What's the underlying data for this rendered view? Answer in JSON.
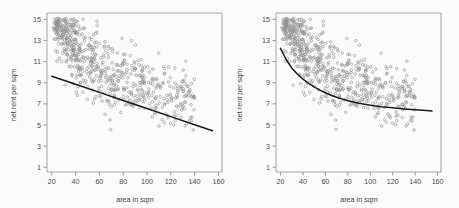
{
  "figure": {
    "background_color": "#fbfbfb",
    "point_color": "#8f8f8f",
    "line_color": "#1a1a1a",
    "axis_color": "#8d8d8d",
    "panels": 2
  },
  "chart_data": [
    {
      "type": "scatter",
      "title": "",
      "subtitle": "",
      "panel": "left",
      "xlabel": "area in sqm",
      "ylabel": "net rent per sqm",
      "xlim": [
        16,
        163
      ],
      "ylim": [
        0.55,
        15.6
      ],
      "xticks": [
        20,
        40,
        60,
        80,
        100,
        120,
        140,
        160
      ],
      "xticklabels": [
        "20",
        "40",
        "60",
        "80",
        "100",
        "120",
        "140",
        "160"
      ],
      "yticks": [
        1,
        3,
        5,
        7,
        9,
        11,
        13,
        15
      ],
      "yticklabels": [
        "1",
        "3",
        "5",
        "7",
        "9",
        "11",
        "13",
        "15"
      ],
      "grid": false,
      "legend": null,
      "annotations": [],
      "series": [
        {
          "name": "observations",
          "marker": "open-circle",
          "color": "#8f8f8f",
          "n_points": 620,
          "x_range": [
            20,
            155
          ],
          "y_range": [
            2.0,
            15.0
          ]
        },
        {
          "name": "linear fit",
          "type": "line",
          "color": "#1a1a1a",
          "x": [
            20,
            40,
            60,
            80,
            100,
            120,
            140,
            155
          ],
          "y": [
            9.62,
            8.85,
            8.09,
            7.32,
            6.56,
            5.79,
            5.03,
            4.45
          ]
        }
      ]
    },
    {
      "type": "scatter",
      "title": "",
      "subtitle": "",
      "panel": "right",
      "xlabel": "area in sqm",
      "ylabel": "net rent per sqm",
      "xlim": [
        16,
        163
      ],
      "ylim": [
        0.55,
        15.6
      ],
      "xticks": [
        20,
        40,
        60,
        80,
        100,
        120,
        140,
        160
      ],
      "xticklabels": [
        "20",
        "40",
        "60",
        "80",
        "100",
        "120",
        "140",
        "160"
      ],
      "yticks": [
        1,
        3,
        5,
        7,
        9,
        11,
        13,
        15
      ],
      "yticklabels": [
        "1",
        "3",
        "5",
        "7",
        "9",
        "11",
        "13",
        "15"
      ],
      "grid": false,
      "legend": null,
      "annotations": [],
      "series": [
        {
          "name": "observations",
          "marker": "open-circle",
          "color": "#8f8f8f",
          "n_points": 620,
          "x_range": [
            20,
            155
          ],
          "y_range": [
            2.0,
            15.0
          ]
        },
        {
          "name": "smooth fit",
          "type": "line",
          "color": "#1a1a1a",
          "x": [
            20,
            25,
            30,
            35,
            40,
            45,
            50,
            55,
            60,
            65,
            70,
            75,
            80,
            90,
            100,
            110,
            120,
            130,
            140,
            150,
            155
          ],
          "y": [
            12.25,
            11.2,
            10.4,
            9.82,
            9.35,
            8.95,
            8.6,
            8.3,
            8.05,
            7.82,
            7.62,
            7.45,
            7.3,
            7.05,
            6.87,
            6.73,
            6.62,
            6.52,
            6.44,
            6.37,
            6.33
          ]
        }
      ]
    }
  ]
}
